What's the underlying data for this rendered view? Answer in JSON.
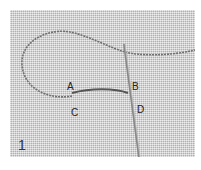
{
  "figure": {
    "number": "1",
    "points": {
      "A": "A",
      "B": "B",
      "C": "C",
      "D": "D"
    },
    "colors": {
      "fabric": "#d6d6d6",
      "thread": "#6a6a6a",
      "needle": "#8a8a8a"
    }
  }
}
